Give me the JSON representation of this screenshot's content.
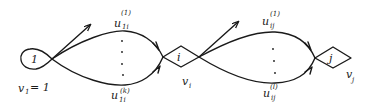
{
  "diagram": {
    "type": "flow-network",
    "nodes": [
      {
        "id": "1",
        "label": "1",
        "shape": "teardrop",
        "value_label": "v",
        "value_sub": "1",
        "value_text": "= 1"
      },
      {
        "id": "i",
        "label": "i",
        "shape": "diamond",
        "value_label": "v",
        "value_sub": "i"
      },
      {
        "id": "j",
        "label": "j",
        "shape": "diamond",
        "value_label": "v",
        "value_sub": "j"
      }
    ],
    "edge_groups": [
      {
        "from": "1",
        "to": "i",
        "top": {
          "base": "u",
          "sub": "1i",
          "sup": "(1)"
        },
        "bottom": {
          "base": "u",
          "sub": "1i",
          "sup": "(k)"
        }
      },
      {
        "from": "i",
        "to": "j",
        "top": {
          "base": "u",
          "sub": "ij",
          "sup": "(1)"
        },
        "bottom": {
          "base": "u",
          "sub": "ij",
          "sup": "(l)"
        }
      }
    ]
  }
}
